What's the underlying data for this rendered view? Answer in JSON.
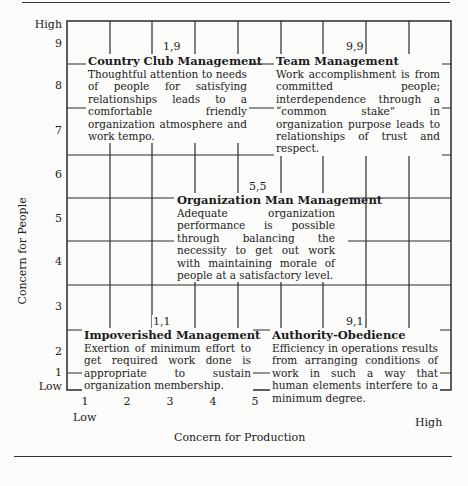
{
  "axes": {
    "y_title": "Concern for People",
    "x_title": "Concern for Production",
    "y_high": "High",
    "y_low": "Low",
    "x_low": "Low",
    "x_high": "High",
    "y_ticks": [
      "9",
      "8",
      "7",
      "6",
      "5",
      "4",
      "3",
      "2",
      "1"
    ],
    "x_ticks": [
      "1",
      "2",
      "3",
      "4",
      "5",
      "6",
      "7",
      "8",
      "9"
    ]
  },
  "styles": [
    {
      "coord": "1,9",
      "title": "Country Club Management",
      "description": "Thoughtful attention to needs of people for satisfying relationships leads to a comfortable friendly organization atmosphere and work tempo."
    },
    {
      "coord": "9,9",
      "title": "Team Management",
      "description": "Work accomplishment is from committed people; interdependence through a “common stake” in organization purpose leads to relationships of trust and respect."
    },
    {
      "coord": "5,5",
      "title": "Organization Man Management",
      "description": "Adequate organization performance is possible through balancing the necessity to get out work with maintaining morale of people at a satisfactory level."
    },
    {
      "coord": "1,1",
      "title": "Impoverished Management",
      "description": "Exertion of minimum effort to get required work done is appropriate to sustain organization membership."
    },
    {
      "coord": "9,1",
      "title": "Authority-Obedience",
      "description": "Efficiency in operations results from arranging conditions of work in such a way that human elements interfere to a minimum degree."
    }
  ],
  "colors": {
    "ink": "#1c1c1c",
    "paper": "#fbfbf9"
  }
}
